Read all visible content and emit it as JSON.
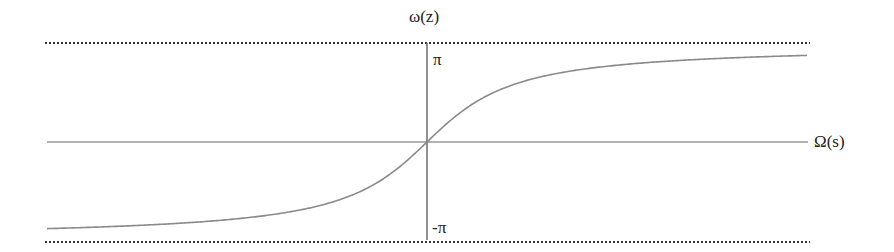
{
  "chart_data": {
    "type": "line",
    "title": "",
    "xlabel": "Ω(s)",
    "ylabel": "ω(z)",
    "y_ticks": [
      "π",
      "-π"
    ],
    "asymptotes": [
      {
        "value": "π",
        "style": "dotted"
      },
      {
        "value": "-π",
        "style": "dotted"
      }
    ],
    "function": "ω = 2·arctan(Ω)",
    "series": [
      {
        "name": "frequency warping",
        "x": [
          -10,
          -5,
          -3,
          -2,
          -1,
          -0.5,
          0,
          0.5,
          1,
          2,
          3,
          5,
          10
        ],
        "y": [
          -2.94,
          -2.75,
          -2.5,
          -2.21,
          -1.57,
          -0.93,
          0,
          0.93,
          1.57,
          2.21,
          2.5,
          2.75,
          2.94
        ]
      }
    ],
    "ylim": [
      -3.14159,
      3.14159
    ],
    "grid": false,
    "legend": null,
    "colors": {
      "curve": "#8a8a8a",
      "axes": "#555555",
      "asymptote": "#333333"
    }
  },
  "labels": {
    "y_axis": "ω(z)",
    "x_axis": "Ω(s)",
    "top_tick": "π",
    "bottom_tick": "-π"
  }
}
